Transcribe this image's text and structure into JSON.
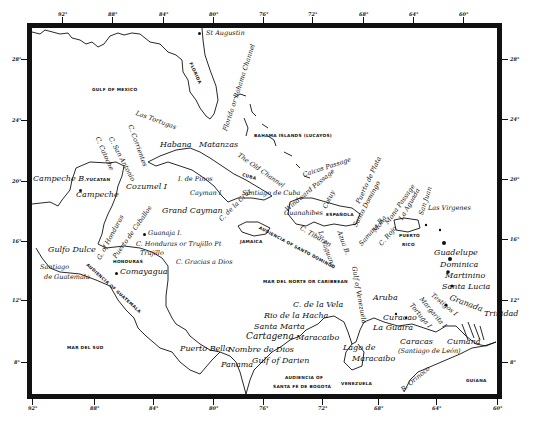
{
  "map": {
    "title": "",
    "colors": {
      "ink": "#111111",
      "paper": "#ffffff"
    },
    "axes": {
      "top_longitudes": [
        {
          "label": "92°",
          "x": 62
        },
        {
          "label": "88°",
          "x": 112
        },
        {
          "label": "84°",
          "x": 163
        },
        {
          "label": "80°",
          "x": 213
        },
        {
          "label": "76°",
          "x": 263
        },
        {
          "label": "72°",
          "x": 312
        },
        {
          "label": "68°",
          "x": 363
        },
        {
          "label": "64°",
          "x": 413
        },
        {
          "label": "60°",
          "x": 463
        }
      ],
      "bottom_longitudes": [
        {
          "label": "92°",
          "x": 32
        },
        {
          "label": "88°",
          "x": 94
        },
        {
          "label": "84°",
          "x": 153
        },
        {
          "label": "80°",
          "x": 213
        },
        {
          "label": "76°",
          "x": 263
        },
        {
          "label": "72°",
          "x": 322
        },
        {
          "label": "68°",
          "x": 378
        },
        {
          "label": "64°",
          "x": 436
        },
        {
          "label": "60°",
          "x": 497
        }
      ],
      "left_latitudes": [
        {
          "label": "28°",
          "y": 59
        },
        {
          "label": "24°",
          "y": 120
        },
        {
          "label": "20°",
          "y": 181
        },
        {
          "label": "16°",
          "y": 241
        },
        {
          "label": "12°",
          "y": 300
        },
        {
          "label": "8°",
          "y": 362
        }
      ],
      "right_latitudes": [
        {
          "label": "28°",
          "y": 59
        },
        {
          "label": "24°",
          "y": 119
        },
        {
          "label": "20°",
          "y": 179
        },
        {
          "label": "16°",
          "y": 239
        },
        {
          "label": "12°",
          "y": 300
        },
        {
          "label": "8°",
          "y": 362
        }
      ]
    },
    "regions": {
      "gulf_of_mexico": "GULF OF MEXICO",
      "florida": "FLORIDA",
      "bahama_islands": "BAHAMA ISLANDS (LUCAYOS)",
      "yucatan": "YUCATAN",
      "cuba": "CUBA",
      "jamaica": "JAMAICA",
      "espanola": "ESPAÑOLA",
      "puerto_rico_1": "PUERTO",
      "puerto_rico_2": "RICO",
      "honduras": "HONDURAS",
      "audiencia_santo_domingo": "AUDIENCIA OF SANTO DOMINGO",
      "audiencia_guatemala": "AUDIENCIA OF GUATEMALA",
      "mar_del_norte": "MAR DEL NORTE OR CARIBBEAN",
      "mar_del_sud": "MAR DEL SUD",
      "audiencia_bogota_1": "AUDIENCIA OF",
      "audiencia_bogota_2": "SANTA FÉ DE BOGOTÁ",
      "venezuela": "VENEZUELA",
      "guiana": "GUIANA"
    },
    "places": {
      "st_augustin": "St Augustin",
      "florida_channel": "Florida or Bahama Channel",
      "las_tortugas": "Las Tortugas",
      "c_corrientes": "C. Corrientes",
      "c_san_antonio": "C. San Antonio",
      "c_catoche": "C. Catoche",
      "habana": "Habana",
      "matanzas": "Matanzas",
      "old_channel": "The Old Channel",
      "caicos_passage": "Caicos Passage",
      "campeche_b": "Campeche B.",
      "campeche": "Campeche",
      "cozumel": "Cozumel I",
      "i_de_pinos": "I. de Pinos",
      "cayman": "Cayman I",
      "grand_cayman": "Grand Cayman",
      "c_de_la_cruz": "C. de la Cruz",
      "santiago_de_cuba": "Santiago de Cuba",
      "windward_passage": "Windward Passage",
      "guanahibes": "Guanahibes",
      "c_tiburon": "C. Tiburon",
      "la_yaguana": "La Yaguana",
      "cotuy": "Cotuy",
      "azua": "Azua B.",
      "santo_domingo": "Santo Domingo",
      "puerto_de_plata": "Puerto de Plata",
      "samana": "Samana B.",
      "mona_passage": "Mona Passage",
      "mona": "Mona",
      "la_aguada": "La Aguada",
      "san_juan": "San Juan",
      "c_rojo": "C. Rojo",
      "las_virgenes": "Las Virgenes",
      "g_of_honduras": "G. of Honduras",
      "puerto_de_caballos": "Puerto de Caballos",
      "guanaja": "Guanaja I.",
      "c_honduras": "C. Honduras or Trujillo Pt",
      "trujillo": "Trujillo",
      "gulfo_dulce": "Gulfo Dulce",
      "c_gracias_a_dios": "C. Gracias a Dios",
      "santiago_de_guatemala_1": "Santiago",
      "santiago_de_guatemala_2": "de Guatemala",
      "comayagua": "Comayagua",
      "guadelupe": "Guadelupe",
      "dominica": "Dominica",
      "martinino": "Martinino",
      "santa_lucia": "Santa Lucia",
      "granada": "Granada",
      "testigos": "Testigos I",
      "margarita": "Margarita I",
      "tortuga": "Tortuga I",
      "trinidad": "Trinidad",
      "aruba": "Aruba",
      "curacao": "Curacao",
      "la_guaira": "La Guaira",
      "caracas_1": "Caracas",
      "caracas_2": "(Santiago de León)",
      "cumana": "Cumaná",
      "c_de_la_vela": "C. de la Vela",
      "rio_de_la_hacha": "Rio de la Hacha",
      "santa_marta": "Santa Marta",
      "cartagena": "Cartagena",
      "maracaibo": "Maracaibo",
      "lago_de_maracaibo_1": "Lago de",
      "lago_de_maracaibo_2": "Maracaibo",
      "gulf_of_venezuela": "Gulf of Venezuela",
      "puerto_bello": "Puerto Bello",
      "nombre_de_dios": "Nombre de Dios",
      "panama": "Panama",
      "gulf_of_darien": "Gulf of Darien",
      "r_orinoco": "R. Orinoco"
    }
  }
}
